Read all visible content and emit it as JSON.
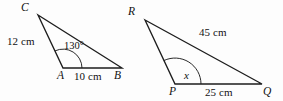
{
  "figure": {
    "background_color": "#fdfdfd",
    "stroke_color": "#1d1d1d",
    "text_color": "#111111",
    "triangles": [
      {
        "name": "triangle-abc",
        "vertices": {
          "C": {
            "label": "C",
            "x": 38,
            "y": 15,
            "label_x": 21,
            "label_y": 2
          },
          "A": {
            "label": "A",
            "x": 63,
            "y": 68,
            "label_x": 57,
            "label_y": 70
          },
          "B": {
            "label": "B",
            "x": 122,
            "y": 68,
            "label_x": 114,
            "label_y": 70
          }
        },
        "sides": [
          {
            "name": "side-ca",
            "label": "12 cm",
            "label_x": 7,
            "label_y": 36
          },
          {
            "name": "side-ab",
            "label": "10 cm",
            "label_x": 74,
            "label_y": 71
          }
        ],
        "angles": [
          {
            "name": "angle-a",
            "label": "130°",
            "label_x": 64,
            "label_y": 41,
            "at_vertex": "A",
            "arc_radius": 19
          }
        ]
      },
      {
        "name": "triangle-pqr",
        "vertices": {
          "R": {
            "label": "R",
            "x": 145,
            "y": 20,
            "label_x": 128,
            "label_y": 6
          },
          "P": {
            "label": "P",
            "x": 175,
            "y": 84,
            "label_x": 169,
            "label_y": 86
          },
          "Q": {
            "label": "Q",
            "x": 262,
            "y": 84,
            "label_x": 263,
            "label_y": 86
          }
        },
        "sides": [
          {
            "name": "side-rq",
            "label": "45 cm",
            "label_x": 199,
            "label_y": 27
          },
          {
            "name": "side-pq",
            "label": "25 cm",
            "label_x": 205,
            "label_y": 87
          }
        ],
        "angles": [
          {
            "name": "angle-p",
            "label": "x",
            "label_x": 184,
            "label_y": 70,
            "at_vertex": "P",
            "arc_radius": 26
          }
        ]
      }
    ]
  }
}
